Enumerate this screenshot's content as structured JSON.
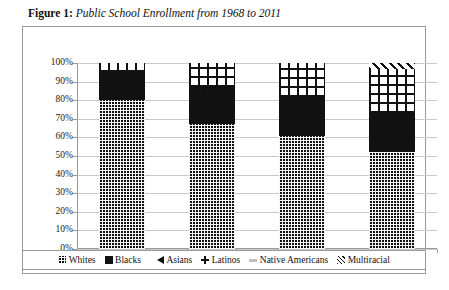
{
  "caption": {
    "figure_label": "Figure 1",
    "separator": ": ",
    "title": "Public School Enrollment from 1968 to 2011"
  },
  "chart_data": {
    "type": "bar",
    "stacked": true,
    "title": "Public School Enrollment from 1968 to 2011",
    "xlabel": "",
    "ylabel": "",
    "ylim": [
      0,
      100
    ],
    "ytick_labels": [
      "100%",
      "90%",
      "80%",
      "70%",
      "60%",
      "50%",
      "40%",
      "30%",
      "20%",
      "10%",
      "0%"
    ],
    "ytick_values": [
      100,
      90,
      80,
      70,
      60,
      50,
      40,
      30,
      20,
      10,
      0
    ],
    "grid": true,
    "legend_position": "bottom",
    "categories": [
      "1968",
      "1991",
      "2001",
      "2011"
    ],
    "series": [
      {
        "name": "Whites",
        "pattern": "dense-grid",
        "values": [
          80,
          67,
          61,
          52
        ]
      },
      {
        "name": "Blacks",
        "pattern": "solid-black",
        "values": [
          15,
          16,
          17,
          16
        ]
      },
      {
        "name": "Asians",
        "pattern": "diamonds",
        "values": [
          0,
          4,
          4,
          5
        ]
      },
      {
        "name": "Latinos",
        "pattern": "bold-grid",
        "values": [
          5,
          13,
          18,
          24
        ]
      },
      {
        "name": "Native Americans",
        "pattern": "light-gray",
        "values": [
          0,
          0,
          0,
          0
        ]
      },
      {
        "name": "Multiracial",
        "pattern": "diagonal-hatch",
        "values": [
          0,
          0,
          0,
          3
        ]
      }
    ]
  },
  "legend": {
    "items": [
      {
        "label": "Whites",
        "key": "whites-swatch-icon"
      },
      {
        "label": "Blacks",
        "key": "blacks-swatch-icon"
      },
      {
        "label": "Asians",
        "key": "asians-swatch-icon"
      },
      {
        "label": "Latinos",
        "key": "latinos-swatch-icon"
      },
      {
        "label": "Native Americans",
        "key": "native-americans-swatch-icon"
      },
      {
        "label": "Multiracial",
        "key": "multiracial-swatch-icon"
      }
    ]
  }
}
